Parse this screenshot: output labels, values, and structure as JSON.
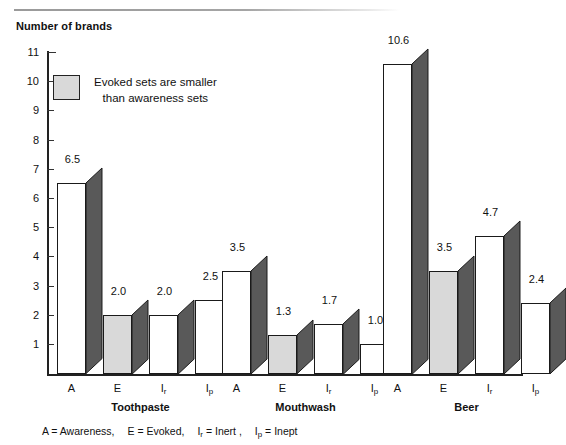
{
  "figure": {
    "axis_title": "Number of brands",
    "footnote_items": [
      {
        "abbr": "A",
        "sub": "",
        "name": "Awareness,"
      },
      {
        "abbr": "E",
        "sub": "",
        "name": "Evoked,"
      },
      {
        "abbr": "I",
        "sub": "r",
        "name": "Inert ,"
      },
      {
        "abbr": "I",
        "sub": "p",
        "name": "Inept"
      }
    ]
  },
  "legend": {
    "line1": "Evoked sets are smaller",
    "line2": "than awareness sets",
    "swatch_color": "#d9d9d9"
  },
  "colors": {
    "bar_front": "#ffffff",
    "bar_front_shaded": "#d9d9d9",
    "bar_side": "#595959",
    "bar_outline": "#1a1a1a",
    "axis": "#222222",
    "text": "#111111"
  },
  "chart_data": {
    "type": "bar",
    "title": "",
    "xlabel": "",
    "ylabel": "Number of brands",
    "ylim": [
      0,
      11
    ],
    "yticks": [
      1,
      2,
      3,
      4,
      5,
      6,
      7,
      8,
      9,
      10,
      11
    ],
    "grid": false,
    "legend_position": "inside-top-left",
    "categories": [
      "A",
      "E",
      "I r",
      "I p"
    ],
    "category_labels": [
      {
        "base": "A",
        "sub": ""
      },
      {
        "base": "E",
        "sub": ""
      },
      {
        "base": "I",
        "sub": "r"
      },
      {
        "base": "I",
        "sub": "p"
      }
    ],
    "groups": [
      {
        "name": "Toothpaste",
        "values": [
          6.5,
          2.0,
          2.0,
          2.5
        ],
        "labels": [
          "6.5",
          "2.0",
          "2.0",
          "2.5"
        ],
        "shaded": [
          false,
          true,
          false,
          false
        ]
      },
      {
        "name": "Mouthwash",
        "values": [
          3.5,
          1.3,
          1.7,
          1.0
        ],
        "labels": [
          "3.5",
          "1.3",
          "1.7",
          "1.0"
        ],
        "shaded": [
          false,
          true,
          false,
          false
        ]
      },
      {
        "name": "Beer",
        "values": [
          10.6,
          3.5,
          4.7,
          2.4
        ],
        "labels": [
          "10.6",
          "3.5",
          "4.7",
          "2.4"
        ],
        "shaded": [
          false,
          true,
          false,
          false
        ]
      }
    ]
  }
}
